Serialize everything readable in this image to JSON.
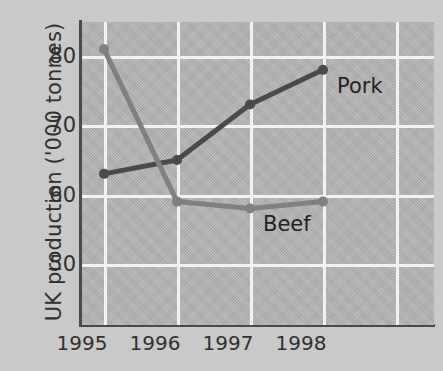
{
  "chart_data": {
    "type": "line",
    "title": "",
    "xlabel": "",
    "ylabel": "UK production ('000 tonnes)",
    "categories": [
      "1995",
      "1996",
      "1997",
      "1998"
    ],
    "x_tick_labels": [
      "1995",
      "1996",
      "1997",
      "1998"
    ],
    "y_tick_labels": [
      "50",
      "60",
      "70",
      "80"
    ],
    "y_ticks": [
      50,
      60,
      70,
      80
    ],
    "ylim": [
      44,
      85
    ],
    "xlim": [
      1994.6,
      1998.6
    ],
    "grid": "both",
    "legend_position": "inline-end-of-line",
    "series": [
      {
        "name": "Pork",
        "color": "#4a4a4a",
        "values": [
          63,
          65,
          73,
          78
        ],
        "label": "Pork",
        "markers": "filled-circle"
      },
      {
        "name": "Beef",
        "color": "#808080",
        "values": [
          81,
          59,
          58,
          59
        ],
        "label": "Beef",
        "markers": "filled-circle"
      }
    ],
    "annotations": [
      {
        "text": "Pork",
        "series": "Pork"
      },
      {
        "text": "Beef",
        "series": "Beef"
      }
    ]
  },
  "style": {
    "figure_background": "#c9c9c9",
    "plot_background": "#b2b2b2",
    "grid_color": "#f2f2f2",
    "axis_color": "#4a4a4a",
    "text_color": "#303030",
    "pork_color": "#4a4a4a",
    "beef_color": "#808080"
  }
}
